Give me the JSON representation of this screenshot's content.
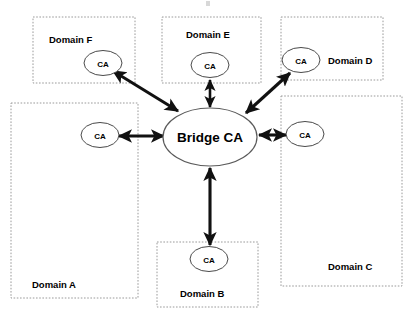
{
  "diagram": {
    "hub": {
      "label": "Bridge CA",
      "name": "bridge-ca-node"
    },
    "colors": {
      "box_stroke": "#9a9a9a",
      "node_stroke": "#4a4a4a",
      "arrow": "#111111",
      "background": "#ffffff",
      "text": "#000000"
    },
    "domains": [
      {
        "id": "f",
        "label": "Domain F",
        "ca_label": "CA",
        "box": {
          "x": 33,
          "y": 17,
          "w": 102,
          "h": 66
        },
        "label_pos": {
          "x": 49,
          "y": 43
        },
        "ca_pos": {
          "cx": 103,
          "cy": 63,
          "rx": 19,
          "ry": 12.5
        }
      },
      {
        "id": "e",
        "label": "Domain E",
        "ca_label": "CA",
        "box": {
          "x": 162,
          "y": 17,
          "w": 99,
          "h": 66
        },
        "label_pos": {
          "x": 186,
          "y": 38
        },
        "ca_pos": {
          "cx": 210,
          "cy": 65,
          "rx": 19,
          "ry": 12.5
        }
      },
      {
        "id": "d",
        "label": "Domain D",
        "ca_label": "CA",
        "box": {
          "x": 281,
          "y": 17,
          "w": 102,
          "h": 63
        },
        "label_pos": {
          "x": 328,
          "y": 64
        },
        "ca_pos": {
          "cx": 301,
          "cy": 60,
          "rx": 19,
          "ry": 12.5
        }
      },
      {
        "id": "c",
        "label": "Domain C",
        "ca_label": "CA",
        "box": {
          "x": 281,
          "y": 96,
          "w": 121,
          "h": 190
        },
        "label_pos": {
          "x": 328,
          "y": 270
        },
        "ca_pos": {
          "cx": 305,
          "cy": 134,
          "rx": 19,
          "ry": 12.5
        }
      },
      {
        "id": "b",
        "label": "Domain B",
        "ca_label": "CA",
        "box": {
          "x": 157,
          "y": 242,
          "w": 101,
          "h": 65
        },
        "label_pos": {
          "x": 180,
          "y": 297
        },
        "ca_pos": {
          "cx": 209,
          "cy": 259,
          "rx": 19,
          "ry": 12.5
        }
      },
      {
        "id": "a",
        "label": "Domain A",
        "ca_label": "CA",
        "box": {
          "x": 11,
          "y": 103,
          "w": 127,
          "h": 195
        },
        "label_pos": {
          "x": 32,
          "y": 288
        },
        "ca_pos": {
          "cx": 100,
          "cy": 135,
          "rx": 19,
          "ry": 12.5
        }
      }
    ],
    "connections": [
      {
        "id": "bridge-to-f",
        "from": "bridge-ca",
        "to": "domain-f-ca",
        "x1": 178,
        "y1": 111,
        "x2": 113,
        "y2": 71,
        "double": true
      },
      {
        "id": "bridge-to-e",
        "from": "bridge-ca",
        "to": "domain-e-ca",
        "x1": 210,
        "y1": 108,
        "x2": 210,
        "y2": 79,
        "double": true
      },
      {
        "id": "bridge-to-d",
        "from": "bridge-ca",
        "to": "domain-d-ca",
        "x1": 246,
        "y1": 113,
        "x2": 290,
        "y2": 73,
        "double": true
      },
      {
        "id": "bridge-to-c",
        "from": "bridge-ca",
        "to": "domain-c-ca",
        "x1": 259,
        "y1": 135,
        "x2": 287,
        "y2": 135,
        "double": true
      },
      {
        "id": "bridge-to-b",
        "from": "bridge-ca",
        "to": "domain-b-ca",
        "x1": 210,
        "y1": 167,
        "x2": 210,
        "y2": 245,
        "double": true
      },
      {
        "id": "bridge-to-a",
        "from": "bridge-ca",
        "to": "domain-a-ca",
        "x1": 164,
        "y1": 136,
        "x2": 118,
        "y2": 136,
        "double": true
      }
    ]
  }
}
